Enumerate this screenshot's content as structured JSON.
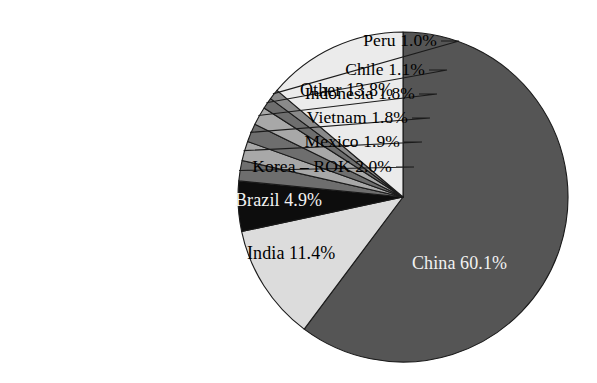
{
  "chart_data": {
    "type": "pie",
    "title": "",
    "subtitle": "",
    "xlabel": "",
    "ylabel": "",
    "legend_position": "none",
    "grid": false,
    "units": "percent",
    "start_angle_deg": 0,
    "direction": "clockwise",
    "categories": [
      "China",
      "India",
      "Brazil",
      "Korea – ROK",
      "Mexico",
      "Vietnam",
      "Indonesia",
      "Chile",
      "Peru",
      "Other"
    ],
    "values": [
      60.1,
      11.4,
      4.9,
      2.0,
      1.9,
      1.8,
      1.8,
      1.1,
      1.0,
      13.8
    ],
    "slices": [
      {
        "name": "China",
        "value": 60.1,
        "label": "China 60.1%",
        "color": "#555555",
        "label_placement": "inside",
        "label_color": "#f2f2f2",
        "label_x": 412,
        "label_y": 253
      },
      {
        "name": "India",
        "value": 11.4,
        "label": "India 11.4%",
        "color": "#dcdcdc",
        "label_placement": "inside",
        "label_color": "#000000",
        "label_x": 247,
        "label_y": 243
      },
      {
        "name": "Brazil",
        "value": 4.9,
        "label": "Brazil 4.9%",
        "color": "#0d0d0d",
        "label_placement": "inside",
        "label_color": "#f2f2f2",
        "label_x": 235,
        "label_y": 190
      },
      {
        "name": "Korea – ROK",
        "value": 2.0,
        "label": "Korea – ROK 2.0%",
        "color": "#6e6e6e",
        "label_placement": "outside",
        "label_color": "#000000",
        "label_right": 392,
        "label_y": 156
      },
      {
        "name": "Mexico",
        "value": 1.9,
        "label": "Mexico 1.9%",
        "color": "#a8a8a8",
        "label_placement": "outside",
        "label_color": "#000000",
        "label_right": 400,
        "label_y": 131
      },
      {
        "name": "Vietnam",
        "value": 1.8,
        "label": "Vietnam 1.8%",
        "color": "#6e6e6e",
        "label_placement": "outside",
        "label_color": "#000000",
        "label_right": 408,
        "label_y": 107
      },
      {
        "name": "Indonesia",
        "value": 1.8,
        "label": "Indonesia 1.8%",
        "color": "#a8a8a8",
        "label_placement": "outside",
        "label_color": "#000000",
        "label_right": 415,
        "label_y": 83
      },
      {
        "name": "Chile",
        "value": 1.1,
        "label": "Chile 1.1%",
        "color": "#6e6e6e",
        "label_placement": "outside",
        "label_color": "#000000",
        "label_right": 425,
        "label_y": 59
      },
      {
        "name": "Peru",
        "value": 1.0,
        "label": "Peru 1.0%",
        "color": "#8a8a8a",
        "label_placement": "outside",
        "label_color": "#000000",
        "label_right": 437,
        "label_y": 30
      },
      {
        "name": "Other",
        "value": 13.8,
        "label": "Other 13.8%",
        "color": "#ebebeb",
        "label_placement": "inside",
        "label_color": "#000000",
        "label_x": 300,
        "label_y": 80
      }
    ],
    "geometry": {
      "center_x": 403,
      "center_y": 197,
      "radius": 165
    }
  }
}
